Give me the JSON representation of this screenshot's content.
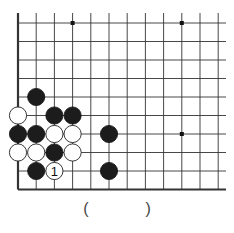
{
  "diagram": {
    "type": "go-board-fragment",
    "grid": {
      "columns": 12,
      "rows": 10,
      "x0": 18,
      "dx": 18.2,
      "y0": 23,
      "dy": 18.5,
      "right_extend": 226,
      "top_extend": 13,
      "left_edge": true,
      "bottom_edge": true,
      "line_color": "#333333"
    },
    "star_points": [
      {
        "col": 3,
        "row": 0
      },
      {
        "col": 9,
        "row": 0
      },
      {
        "col": 9,
        "row": 6
      }
    ],
    "stones": [
      {
        "color": "black",
        "col": 1,
        "row": 4
      },
      {
        "color": "white",
        "col": 0,
        "row": 5
      },
      {
        "color": "black",
        "col": 2,
        "row": 5
      },
      {
        "color": "black",
        "col": 3,
        "row": 5
      },
      {
        "color": "black",
        "col": 0,
        "row": 6
      },
      {
        "color": "black",
        "col": 1,
        "row": 6
      },
      {
        "color": "white",
        "col": 2,
        "row": 6
      },
      {
        "color": "white",
        "col": 3,
        "row": 6
      },
      {
        "color": "black",
        "col": 5,
        "row": 6
      },
      {
        "color": "white",
        "col": 0,
        "row": 7
      },
      {
        "color": "white",
        "col": 1,
        "row": 7
      },
      {
        "color": "black",
        "col": 2,
        "row": 7
      },
      {
        "color": "white",
        "col": 3,
        "row": 7
      },
      {
        "color": "black",
        "col": 1,
        "row": 8
      },
      {
        "color": "white",
        "col": 2,
        "row": 8,
        "label": "1"
      },
      {
        "color": "black",
        "col": 5,
        "row": 8
      }
    ]
  },
  "answer": {
    "open": "(",
    "close": ")"
  }
}
